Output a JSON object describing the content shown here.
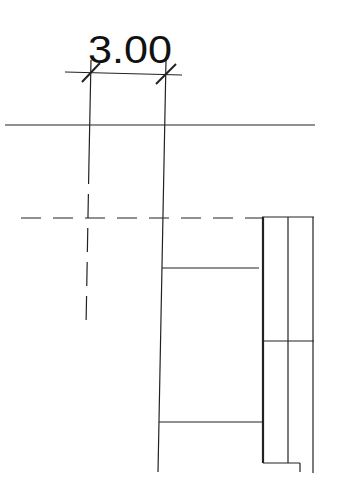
{
  "drawing": {
    "type": "architectural-section-detail",
    "dimension": {
      "label": "3.00"
    },
    "colors": {
      "line": "#222222",
      "background": "#ffffff"
    }
  }
}
